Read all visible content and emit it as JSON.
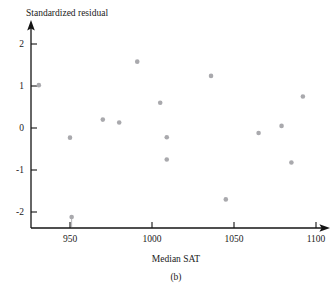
{
  "chart_data": {
    "type": "scatter",
    "title": "",
    "xlabel": "Median SAT",
    "ylabel": "Standardized residual",
    "panel_label": "(b)",
    "xlim": [
      920,
      1105
    ],
    "ylim": [
      -2.45,
      2.3
    ],
    "xticks": [
      950,
      1000,
      1050,
      1100
    ],
    "xtick_labels": [
      "950",
      "1000",
      "1050",
      "1100"
    ],
    "yticks": [
      -2,
      -1,
      0,
      1,
      2
    ],
    "ytick_labels": [
      "-2",
      "-1",
      "0",
      "1",
      "2"
    ],
    "grid": false,
    "legend": false,
    "marker_color": "#a9a9ad",
    "axis_color": "#141414",
    "points": [
      {
        "x": 931,
        "y": 1.02
      },
      {
        "x": 950,
        "y": -0.23
      },
      {
        "x": 951,
        "y": -2.12
      },
      {
        "x": 970,
        "y": 0.2
      },
      {
        "x": 980,
        "y": 0.13
      },
      {
        "x": 991,
        "y": 1.58
      },
      {
        "x": 1005,
        "y": 0.6
      },
      {
        "x": 1009,
        "y": -0.22
      },
      {
        "x": 1009,
        "y": -0.75
      },
      {
        "x": 1036,
        "y": 1.24
      },
      {
        "x": 1045,
        "y": -1.7
      },
      {
        "x": 1065,
        "y": -0.12
      },
      {
        "x": 1079,
        "y": 0.05
      },
      {
        "x": 1085,
        "y": -0.82
      },
      {
        "x": 1092,
        "y": 0.75
      }
    ]
  },
  "axis_titles": {
    "y": "Standardized residual",
    "x": "Median SAT"
  },
  "caption": {
    "panel": "(b)"
  }
}
